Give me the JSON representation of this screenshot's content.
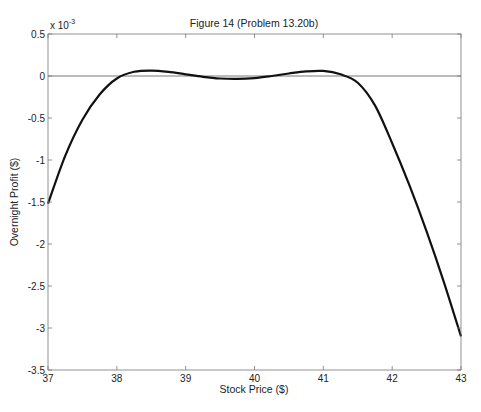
{
  "chart_data": {
    "type": "line",
    "title": "Figure 14 (Problem 13.20b)",
    "xlabel": "Stock Price ($)",
    "ylabel": "Overnight Profit ($)",
    "y_multiplier_label": "x 10",
    "y_multiplier_exponent": "-3",
    "xlim": [
      37,
      43
    ],
    "ylim": [
      -3.5,
      0.5
    ],
    "x_ticks": [
      "37",
      "38",
      "39",
      "40",
      "41",
      "42",
      "43"
    ],
    "y_ticks": [
      "0.5",
      "0",
      "-0.5",
      "-1",
      "-1.5",
      "-2",
      "-2.5",
      "-3",
      "-3.5"
    ],
    "grid": false,
    "legend": null,
    "reference_line": {
      "y": 0,
      "color": "#555555"
    },
    "series": [
      {
        "name": "Overnight Profit",
        "color": "#111111",
        "x": [
          37,
          37.25,
          37.5,
          37.75,
          38,
          38.25,
          38.5,
          38.75,
          39,
          39.25,
          39.5,
          39.75,
          40,
          40.25,
          40.5,
          40.75,
          41,
          41.25,
          41.5,
          41.75,
          42,
          42.25,
          42.5,
          42.75,
          43
        ],
        "values": [
          -1.52,
          -0.95,
          -0.52,
          -0.22,
          -0.03,
          0.05,
          0.065,
          0.05,
          0.02,
          -0.01,
          -0.03,
          -0.035,
          -0.025,
          0.0,
          0.03,
          0.055,
          0.06,
          0.02,
          -0.08,
          -0.35,
          -0.8,
          -1.3,
          -1.85,
          -2.45,
          -3.1
        ]
      }
    ]
  }
}
